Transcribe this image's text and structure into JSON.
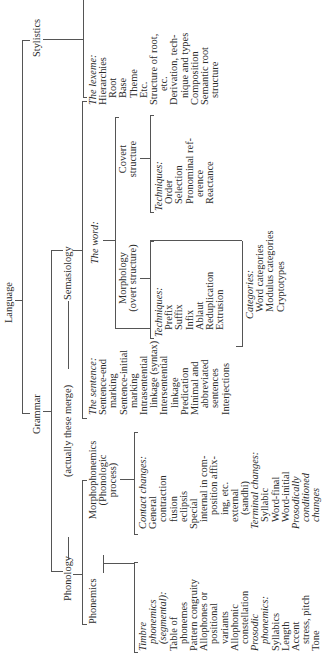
{
  "root": "Language",
  "level1": {
    "grammar": "Grammar",
    "stylistics": "Stylistics"
  },
  "level2": {
    "phonology": "Phonology",
    "merge_note": "(actually these merge)",
    "semasiology": "Semasiology"
  },
  "phonemics": {
    "title": "Phonemics",
    "items": [
      {
        "text": "Timbre",
        "style": "italic",
        "indent": 0
      },
      {
        "text": "phonemics",
        "style": "italic",
        "indent": 1
      },
      {
        "text": "(segmental):",
        "style": "italic",
        "indent": 1
      },
      {
        "text": "Table of",
        "indent": 0
      },
      {
        "text": "phonemes",
        "indent": 1
      },
      {
        "text": "Pattern congruity",
        "indent": 0
      },
      {
        "text": "Allophones or",
        "indent": 0
      },
      {
        "text": "positional",
        "indent": 1
      },
      {
        "text": "variants",
        "indent": 1
      },
      {
        "text": "Allophonic",
        "indent": 0
      },
      {
        "text": "constellation",
        "indent": 1
      },
      {
        "text": "Prosodic",
        "style": "italic",
        "indent": 0
      },
      {
        "text": "phonemics:",
        "style": "italic",
        "indent": 1
      },
      {
        "text": "Syllabics",
        "indent": 0
      },
      {
        "text": "Length",
        "indent": 0
      },
      {
        "text": "Accent",
        "indent": 0
      },
      {
        "text": "stress, pitch",
        "indent": 1
      },
      {
        "text": "Tone",
        "indent": 0
      }
    ]
  },
  "morphophonemics": {
    "title": "Morphophonemics",
    "subtitle1": "(Phonologic",
    "subtitle2": "process)",
    "items": [
      {
        "text": "Contact changes:",
        "style": "italic",
        "indent": 0
      },
      {
        "text": "General",
        "indent": 0
      },
      {
        "text": "contraction",
        "indent": 1
      },
      {
        "text": "fusion",
        "indent": 1
      },
      {
        "text": "eclipsis",
        "indent": 1
      },
      {
        "text": "Special",
        "indent": 0
      },
      {
        "text": "internal in com-",
        "indent": 1
      },
      {
        "text": "position affix-",
        "indent": 2
      },
      {
        "text": "ing, etc.",
        "indent": 2
      },
      {
        "text": "external",
        "indent": 1
      },
      {
        "text": "(sandhi)",
        "indent": 2
      },
      {
        "text": "Terminal changes:",
        "style": "italic",
        "indent": 0
      },
      {
        "text": "Syllabic",
        "indent": 1
      },
      {
        "text": "Word-final",
        "indent": 1
      },
      {
        "text": "Word-initial",
        "indent": 1
      },
      {
        "text": "Prosodically",
        "style": "italic",
        "indent": 0
      },
      {
        "text": "conditioned",
        "style": "italic",
        "indent": 1
      },
      {
        "text": "changes",
        "style": "italic",
        "indent": 1
      }
    ]
  },
  "sentence": {
    "items": [
      {
        "text": "The sentence:",
        "style": "italic",
        "indent": 0
      },
      {
        "text": "Sentence-end",
        "indent": 0
      },
      {
        "text": "marking",
        "indent": 1
      },
      {
        "text": "Sentence-initial",
        "indent": 0
      },
      {
        "text": "marking",
        "indent": 1
      },
      {
        "text": "Intrasentential",
        "indent": 0
      },
      {
        "text": "linkage (syntax)",
        "indent": 1
      },
      {
        "text": "Intersentential",
        "indent": 0
      },
      {
        "text": "linkage",
        "indent": 1
      },
      {
        "text": "Predication",
        "indent": 0
      },
      {
        "text": "Minimal and",
        "indent": 0
      },
      {
        "text": "abbreviated",
        "indent": 1
      },
      {
        "text": "sentences",
        "indent": 1
      },
      {
        "text": "Interjections",
        "indent": 0
      }
    ]
  },
  "word": {
    "title": "The word:",
    "morphology": {
      "line1": "Morphology",
      "line2": "(overt structure)",
      "items": [
        {
          "text": "Techniques:",
          "style": "italic",
          "indent": 0
        },
        {
          "text": "Prefix",
          "indent": 1
        },
        {
          "text": "Suffix",
          "indent": 1
        },
        {
          "text": "Infix",
          "indent": 1
        },
        {
          "text": "Ablaut",
          "indent": 1
        },
        {
          "text": "Reduplication",
          "indent": 1
        },
        {
          "text": "Extrusion",
          "indent": 1
        }
      ]
    },
    "covert": {
      "line1": "Covert",
      "line2": "structure",
      "items": [
        {
          "text": "Techniques:",
          "style": "italic",
          "indent": 0
        },
        {
          "text": "Order",
          "indent": 1
        },
        {
          "text": "Selection",
          "indent": 1
        },
        {
          "text": "Pronominal ref-",
          "indent": 1
        },
        {
          "text": "erence",
          "indent": 2
        },
        {
          "text": "Reactance",
          "indent": 1
        }
      ]
    },
    "categories": [
      {
        "text": "Categories:",
        "style": "italic",
        "indent": 0
      },
      {
        "text": "Word categories",
        "indent": 1
      },
      {
        "text": "Modulus categories",
        "indent": 1
      },
      {
        "text": "Cryptotypes",
        "indent": 1
      }
    ]
  },
  "lexeme": {
    "items": [
      {
        "text": "The lexeme:",
        "style": "italic",
        "indent": 0
      },
      {
        "text": "Hierarchies",
        "indent": 0
      },
      {
        "text": "Root",
        "indent": 1
      },
      {
        "text": "Base",
        "indent": 1
      },
      {
        "text": "Theme",
        "indent": 1
      },
      {
        "text": "Etc.",
        "indent": 1
      },
      {
        "text": "Structure of root,",
        "indent": 0
      },
      {
        "text": "etc.",
        "indent": 2
      },
      {
        "text": "Derivation, tech-",
        "indent": 0
      },
      {
        "text": "nique and types",
        "indent": 1
      },
      {
        "text": "Composition",
        "indent": 0
      },
      {
        "text": "Semantic root",
        "indent": 0
      },
      {
        "text": "structure",
        "indent": 1
      }
    ]
  },
  "stylistics_items": [
    {
      "text": "Conversation style",
      "indent": 0
    },
    {
      "text": "Rhetoric style",
      "indent": 0
    },
    {
      "text": "speeches",
      "indent": 1
    },
    {
      "text": "proclamations,",
      "indent": 2
    },
    {
      "text": "etc.",
      "indent": 3
    },
    {
      "text": "Narrative style",
      "indent": 0
    },
    {
      "text": "ordinary",
      "indent": 1
    },
    {
      "text": "mythological",
      "indent": 2
    },
    {
      "text": "Song or poetical",
      "indent": 0
    },
    {
      "text": "style",
      "indent": 1
    },
    {
      "text": "Magic or incantation",
      "indent": 0
    },
    {
      "text": "style",
      "indent": 1
    },
    {
      "text": "Esoteric interpreta-",
      "indent": 0
    },
    {
      "text": "tion",
      "indent": 1
    },
    {
      "text": "Word avoidances",
      "indent": 0
    },
    {
      "text": "Sex styles",
      "indent": 0
    }
  ]
}
